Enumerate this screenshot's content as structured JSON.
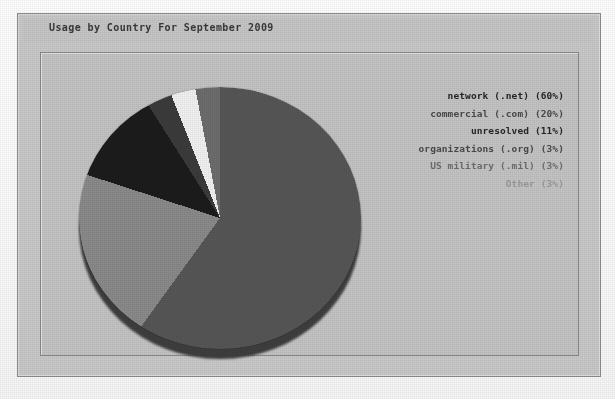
{
  "report": {
    "title": "Usage by Country For September 2009"
  },
  "legend": {
    "entries": [
      {
        "label": "network (.net) (60%)",
        "name": "network",
        "tone": "lg-dark"
      },
      {
        "label": "commercial (.com) (20%)",
        "name": "commercial",
        "tone": "lg-mid"
      },
      {
        "label": "unresolved (11%)",
        "name": "unresolved",
        "tone": "lg-dark"
      },
      {
        "label": "organizations (.org) (3%)",
        "name": "organizations",
        "tone": "lg-mid"
      },
      {
        "label": "US military (.mil) (3%)",
        "name": "us-military",
        "tone": "lg-soft"
      },
      {
        "label": "Other (3%)",
        "name": "other",
        "tone": "lg-faint"
      }
    ]
  },
  "chart_data": {
    "type": "pie",
    "title": "Usage by Country For September 2009",
    "xlabel": "",
    "ylabel": "",
    "legend_position": "right",
    "grid": false,
    "categories": [
      "network (.net)",
      "commercial (.com)",
      "unresolved",
      "organizations (.org)",
      "US military (.mil)",
      "Other"
    ],
    "values": [
      60,
      20,
      11,
      3,
      3,
      3
    ],
    "unit": "percent",
    "slice_colors": [
      "#565656",
      "#8a8a8a",
      "#1c1c1c",
      "#3b3b3b",
      "#f2f2f2",
      "#6d6d6d"
    ],
    "start_angle_deg": 0,
    "direction": "clockwise"
  },
  "colors": {
    "panel": "#c9c9c9",
    "panel_border": "#8e8e8e",
    "frame": "#c4c4c4",
    "title_text": "#3a3a3a",
    "page": "#fbfbfb"
  }
}
